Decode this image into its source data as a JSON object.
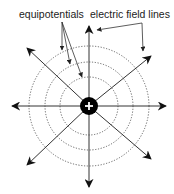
{
  "diagram": {
    "labels": {
      "equipotentials": "equipotentials",
      "field_lines": "electric field lines"
    },
    "charge": {
      "symbol": "+",
      "sign": "positive",
      "center": [
        89,
        106
      ],
      "radius": 9,
      "fill": "#000000",
      "symbol_color": "#ffffff"
    },
    "equipotential_radii": [
      29,
      44,
      60
    ],
    "field_line_directions_deg": [
      0,
      45,
      90,
      135,
      180,
      225,
      270,
      315
    ],
    "field_line_length": 78,
    "colors": {
      "field_line": "#333333",
      "equipotential": "#555555",
      "pointer": "#333333",
      "text": "#222222"
    }
  }
}
